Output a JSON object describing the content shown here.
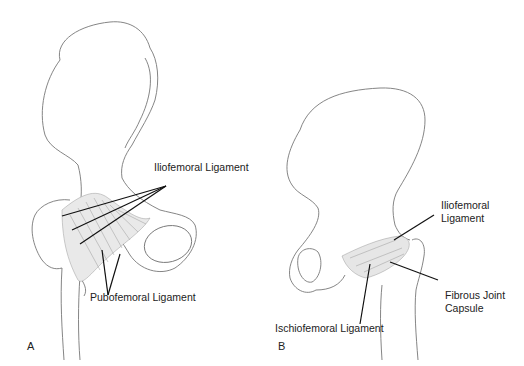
{
  "figure": {
    "panels": [
      {
        "id": "A",
        "letter": "A",
        "view": "anterior hip",
        "labels": {
          "iliofemoral": "Iliofemoral Ligament",
          "pubofemoral": "Pubofemoral Ligament"
        }
      },
      {
        "id": "B",
        "letter": "B",
        "view": "posterior hip",
        "labels": {
          "iliofemoral_line1": "Iliofemoral",
          "iliofemoral_line2": "Ligament",
          "capsule_line1": "Fibrous Joint",
          "capsule_line2": "Capsule",
          "ischiofemoral": "Ischiofemoral Ligament"
        }
      }
    ],
    "colors": {
      "outline": "#6e6e6e",
      "leader": "#111111",
      "ligament_fill": "#cfcfcf",
      "background": "#ffffff"
    }
  }
}
